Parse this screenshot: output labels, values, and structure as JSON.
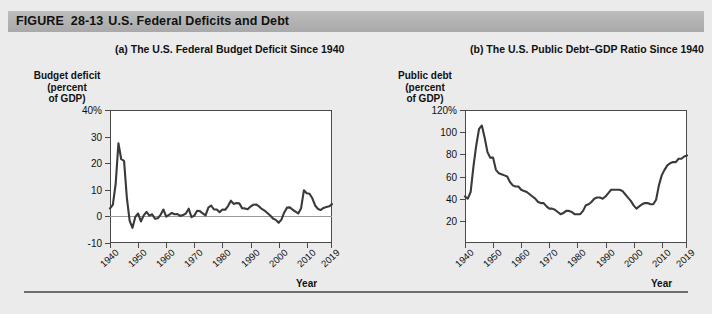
{
  "figure": {
    "label": "FIGURE",
    "number": "28-13",
    "title": "U.S. Federal Deficits and Debt"
  },
  "panel_a": {
    "title": "(a) The U.S. Federal Budget Deficit Since 1940",
    "y_axis_title": "Budget deficit\n(percent\nof GDP)",
    "y_axis_title_lines": [
      "Budget deficit",
      "(percent",
      "of GDP)"
    ],
    "x_axis_title": "Year",
    "y_ticks": [
      "40%",
      "30",
      "20",
      "10",
      "0",
      "-10"
    ],
    "x_ticks": [
      "1940",
      "1950",
      "1960",
      "1970",
      "1980",
      "1990",
      "2000",
      "2010",
      "2019"
    ]
  },
  "panel_b": {
    "title": "(b) The U.S. Public Debt–GDP Ratio Since 1940",
    "y_axis_title_lines": [
      "Public debt",
      "(percent",
      "of GDP)"
    ],
    "x_axis_title": "Year",
    "y_ticks": [
      "120%",
      "100",
      "80",
      "60",
      "40",
      "20"
    ],
    "x_ticks": [
      "1940",
      "1950",
      "1960",
      "1970",
      "1980",
      "1990",
      "2000",
      "2010",
      "2019"
    ]
  },
  "colors": {
    "page_background": "#ebebeb",
    "header_band": "#b4b4b4",
    "plot_background": "#ffffff",
    "line": "#3a3a3a",
    "axis": "#4a4a4a",
    "zero_line": "#9a9a9a"
  },
  "chart_data": [
    {
      "type": "line",
      "id": "panel_a",
      "title": "(a) The U.S. Federal Budget Deficit Since 1940",
      "xlabel": "Year",
      "ylabel": "Budget deficit (percent of GDP)",
      "xlim": [
        1940,
        2019
      ],
      "ylim": [
        -10,
        40
      ],
      "yticks": [
        -10,
        0,
        10,
        20,
        30,
        40
      ],
      "xticks": [
        1940,
        1950,
        1960,
        1970,
        1980,
        1990,
        2000,
        2010,
        2019
      ],
      "grid": false,
      "legend": null,
      "zero_reference_line": 0,
      "x": [
        1940,
        1941,
        1942,
        1943,
        1944,
        1945,
        1946,
        1947,
        1948,
        1949,
        1950,
        1951,
        1952,
        1953,
        1954,
        1955,
        1956,
        1957,
        1958,
        1959,
        1960,
        1961,
        1962,
        1963,
        1964,
        1965,
        1966,
        1967,
        1968,
        1969,
        1970,
        1971,
        1972,
        1973,
        1974,
        1975,
        1976,
        1977,
        1978,
        1979,
        1980,
        1981,
        1982,
        1983,
        1984,
        1985,
        1986,
        1987,
        1988,
        1989,
        1990,
        1991,
        1992,
        1993,
        1994,
        1995,
        1996,
        1997,
        1998,
        1999,
        2000,
        2001,
        2002,
        2003,
        2004,
        2005,
        2006,
        2007,
        2008,
        2009,
        2010,
        2011,
        2012,
        2013,
        2014,
        2015,
        2016,
        2017,
        2018,
        2019
      ],
      "values": [
        3.0,
        4.3,
        12.0,
        27.5,
        21.5,
        20.9,
        7.0,
        -1.7,
        -4.3,
        -0.2,
        1.1,
        -1.9,
        0.4,
        1.7,
        0.3,
        0.8,
        -0.9,
        -0.7,
        0.6,
        2.6,
        -0.1,
        0.6,
        1.3,
        0.8,
        0.9,
        0.2,
        0.5,
        1.1,
        2.9,
        -0.3,
        0.3,
        2.1,
        2.0,
        1.1,
        0.4,
        3.3,
        4.1,
        2.6,
        2.6,
        1.6,
        2.6,
        2.5,
        3.9,
        5.9,
        4.7,
        5.0,
        4.9,
        3.1,
        3.0,
        2.7,
        3.7,
        4.4,
        4.5,
        3.8,
        2.8,
        2.2,
        1.3,
        0.3,
        -0.8,
        -1.3,
        -2.4,
        -1.2,
        1.5,
        3.3,
        3.4,
        2.5,
        1.8,
        1.1,
        3.1,
        9.8,
        8.7,
        8.5,
        6.8,
        4.1,
        2.8,
        2.4,
        3.2,
        3.5,
        3.8,
        4.6
      ],
      "annotations": [
        "WWII peak deficit near 27.5% of GDP in 1943",
        "Surplus (negative deficit) around 1998-2001",
        "2009 deficit near 10% of GDP"
      ]
    },
    {
      "type": "line",
      "id": "panel_b",
      "title": "(b) The U.S. Public Debt–GDP Ratio Since 1940",
      "xlabel": "Year",
      "ylabel": "Public debt (percent of GDP)",
      "xlim": [
        1940,
        2019
      ],
      "ylim": [
        0,
        120
      ],
      "yticks": [
        20,
        40,
        60,
        80,
        100,
        120
      ],
      "xticks": [
        1940,
        1950,
        1960,
        1970,
        1980,
        1990,
        2000,
        2010,
        2019
      ],
      "grid": false,
      "legend": null,
      "x": [
        1940,
        1941,
        1942,
        1943,
        1944,
        1945,
        1946,
        1947,
        1948,
        1949,
        1950,
        1951,
        1952,
        1953,
        1954,
        1955,
        1956,
        1957,
        1958,
        1959,
        1960,
        1961,
        1962,
        1963,
        1964,
        1965,
        1966,
        1967,
        1968,
        1969,
        1970,
        1971,
        1972,
        1973,
        1974,
        1975,
        1976,
        1977,
        1978,
        1979,
        1980,
        1981,
        1982,
        1983,
        1984,
        1985,
        1986,
        1987,
        1988,
        1989,
        1990,
        1991,
        1992,
        1993,
        1994,
        1995,
        1996,
        1997,
        1998,
        1999,
        2000,
        2001,
        2002,
        2003,
        2004,
        2005,
        2006,
        2007,
        2008,
        2009,
        2010,
        2011,
        2012,
        2013,
        2014,
        2015,
        2016,
        2017,
        2018,
        2019
      ],
      "values": [
        42.0,
        40.0,
        46.0,
        69.0,
        88.0,
        103.0,
        106.0,
        95.0,
        82.0,
        77.0,
        77.0,
        66.0,
        63.0,
        62.0,
        61.0,
        60.0,
        55.0,
        52.0,
        51.0,
        51.0,
        48.0,
        47.0,
        46.0,
        44.0,
        42.0,
        40.0,
        37.0,
        36.0,
        36.0,
        33.0,
        31.0,
        31.0,
        30.0,
        28.0,
        26.0,
        27.0,
        29.0,
        29.0,
        28.0,
        26.0,
        26.0,
        26.0,
        29.0,
        34.0,
        35.0,
        37.0,
        40.0,
        41.0,
        41.0,
        40.0,
        42.0,
        45.0,
        48.0,
        48.0,
        48.0,
        48.0,
        47.0,
        44.0,
        41.0,
        38.0,
        34.0,
        31.0,
        33.0,
        35.0,
        36.0,
        36.0,
        35.0,
        35.0,
        39.0,
        52.0,
        61.0,
        66.0,
        70.0,
        72.0,
        73.0,
        73.0,
        76.0,
        76.0,
        78.0,
        79.0
      ],
      "annotations": [
        "Post-WWII peak near 106% of GDP in 1946",
        "Trough near 26% in the mid-1970s and early 1980s",
        "Rises above 75% after 2010"
      ]
    }
  ]
}
